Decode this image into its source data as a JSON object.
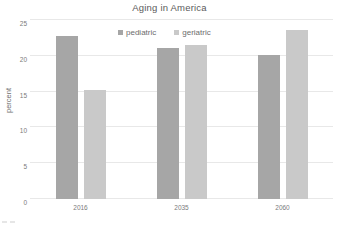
{
  "chart_data": {
    "type": "bar",
    "title": "Aging in America",
    "xlabel": "",
    "ylabel": "percent",
    "categories": [
      "2016",
      "2035",
      "2060"
    ],
    "series": [
      {
        "name": "pediatric",
        "color": "#a6a6a6",
        "values": [
          22.8,
          21.1,
          20.1
        ]
      },
      {
        "name": "geriatric",
        "color": "#c9c9c9",
        "values": [
          15.2,
          21.5,
          23.6
        ]
      }
    ],
    "ylim": [
      0,
      25
    ],
    "yticks": [
      0,
      5,
      10,
      15,
      20,
      25
    ],
    "ytick_labels": [
      "0",
      "5",
      "10",
      "15",
      "20",
      "25"
    ],
    "grid": true,
    "legend_position": "top-center"
  },
  "legend": {
    "entries": [
      {
        "label": "pediatric",
        "swatch": "legend-swatch-pediatric"
      },
      {
        "label": "geriatric",
        "swatch": "legend-swatch-geriatric"
      }
    ]
  }
}
